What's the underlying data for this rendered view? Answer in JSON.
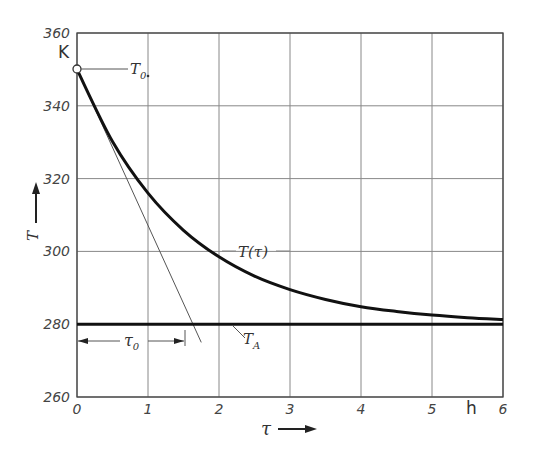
{
  "chart_data": {
    "type": "line",
    "title": "",
    "xlabel": "τ",
    "x_unit": "h",
    "ylabel": "T",
    "y_unit": "K",
    "xlim": [
      0,
      6
    ],
    "ylim": [
      260,
      360
    ],
    "x_ticks": [
      "0",
      "1",
      "2",
      "3",
      "4",
      "5",
      "6"
    ],
    "y_ticks": [
      "260",
      "280",
      "300",
      "320",
      "340",
      "360"
    ],
    "grid": true,
    "legend": null,
    "series": [
      {
        "name": "T(τ)",
        "style": "thick",
        "x": [
          0,
          0.5,
          1,
          1.5,
          2,
          2.5,
          3,
          3.5,
          4,
          4.5,
          5,
          5.5,
          6
        ],
        "values": [
          350,
          330.2,
          316,
          305.8,
          298.5,
          293.2,
          289.5,
          286.8,
          284.8,
          283.5,
          282.5,
          281.8,
          281.3
        ]
      },
      {
        "name": "T_A",
        "style": "thick-horizontal",
        "x": [
          0,
          6
        ],
        "values": [
          280,
          280
        ]
      },
      {
        "name": "tangent at τ=0",
        "style": "thin",
        "x": [
          0,
          1.75
        ],
        "values": [
          350,
          275
        ]
      }
    ],
    "annotations": {
      "T0": {
        "label": "T",
        "sub": "0",
        "value": 350
      },
      "TA": {
        "label": "T",
        "sub": "A",
        "value": 280
      },
      "curve": {
        "label": "T(τ)"
      },
      "time_constant": {
        "label": "τ",
        "sub": "0",
        "value_h": 1.54
      }
    }
  }
}
